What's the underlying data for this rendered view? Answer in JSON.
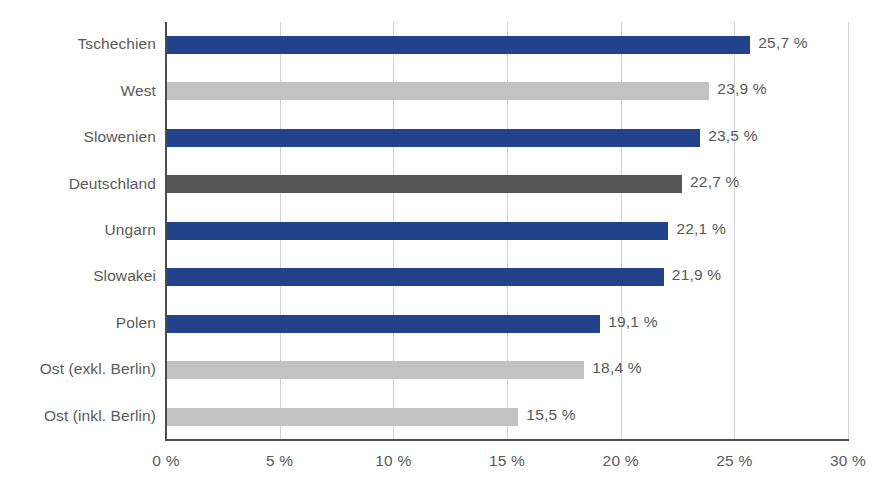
{
  "chart_data": {
    "type": "bar",
    "orientation": "horizontal",
    "title": "",
    "subtitle": "",
    "xlabel": "",
    "ylabel": "",
    "xlim": [
      0,
      30
    ],
    "ylim": null,
    "grid": true,
    "legend": "none",
    "xticks": [
      0,
      5,
      10,
      15,
      20,
      25,
      30
    ],
    "xtick_labels": [
      "0 %",
      "5 %",
      "10 %",
      "15 %",
      "20 %",
      "25 %",
      "30 %"
    ],
    "categories": [
      "Tschechien",
      "West",
      "Slowenien",
      "Deutschland",
      "Ungarn",
      "Slowakei",
      "Polen",
      "Ost (exkl. Berlin)",
      "Ost (inkl. Berlin)"
    ],
    "values": [
      25.7,
      23.9,
      23.5,
      22.7,
      22.1,
      21.9,
      19.1,
      18.4,
      15.5
    ],
    "value_labels": [
      "25,7 %",
      "23,9 %",
      "23,5 %",
      "22,7 %",
      "22,1 %",
      "21,9 %",
      "19,1 %",
      "18,4 %",
      "15,5 %"
    ],
    "bar_colors": [
      "#23428c",
      "#c2c2c2",
      "#23428c",
      "#565656",
      "#23428c",
      "#23428c",
      "#23428c",
      "#c2c2c2",
      "#c2c2c2"
    ]
  },
  "colors": {
    "series_blue": "#23428c",
    "series_light_gray": "#c2c2c2",
    "series_dark_gray": "#565656",
    "axis": "#4d4d4d",
    "gridline": "#d2d2d2",
    "text": "#5a5a5a",
    "background": "#ffffff"
  }
}
